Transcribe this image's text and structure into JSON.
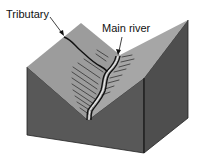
{
  "diagram": {
    "type": "V-shaped river valley block diagram",
    "labels": {
      "tributary": "Tributary",
      "main_river": "Main river"
    },
    "colors": {
      "background": "#ffffff",
      "slope_surface": "#9a9a9a",
      "front_face": "#585858",
      "side_face": "#4e4e4e",
      "river_line": "#111111",
      "hatching": "#333333"
    }
  }
}
